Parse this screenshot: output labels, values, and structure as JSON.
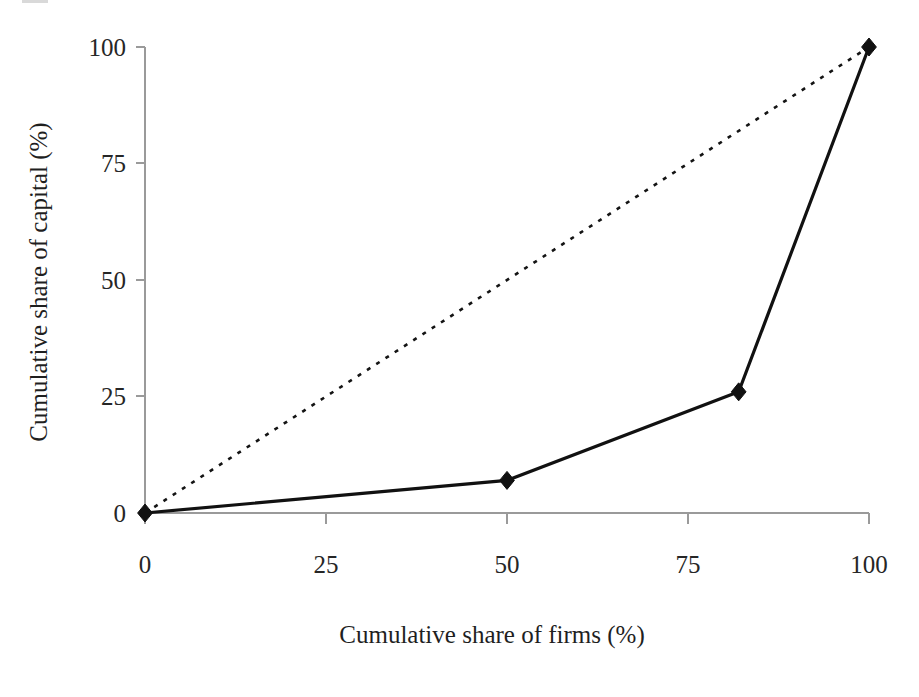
{
  "chart_data": {
    "type": "line",
    "title": "",
    "subtitle": "",
    "xlabel": "Cumulative share of firms (%)",
    "ylabel": "Cumulative share of capital (%)",
    "xlim": [
      0,
      100
    ],
    "ylim": [
      0,
      100
    ],
    "xticks": [
      0,
      25,
      50,
      75,
      100
    ],
    "yticks": [
      0,
      25,
      50,
      75,
      100
    ],
    "xtick_labels": [
      "0",
      "25",
      "50",
      "75",
      "100"
    ],
    "ytick_labels": [
      "0",
      "25",
      "50",
      "75",
      "100"
    ],
    "grid": false,
    "legend_position": "none",
    "series": [
      {
        "name": "Lorenz curve",
        "style": "solid",
        "marker": "diamond",
        "color": "#111111",
        "x": [
          0,
          50,
          82,
          100
        ],
        "y": [
          0,
          7,
          26,
          100
        ]
      },
      {
        "name": "Line of equality",
        "style": "dashed",
        "marker": "none",
        "color": "#141414",
        "x": [
          0,
          100
        ],
        "y": [
          0,
          100
        ]
      }
    ],
    "annotations": []
  },
  "axes": {
    "x_title": "Cumulative share of firms (%)",
    "y_title": "Cumulative share of capital (%)",
    "x_tick_0": "0",
    "x_tick_1": "25",
    "x_tick_2": "50",
    "x_tick_3": "75",
    "x_tick_4": "100",
    "y_tick_0": "0",
    "y_tick_1": "25",
    "y_tick_2": "50",
    "y_tick_3": "75",
    "y_tick_4": "100"
  },
  "colors": {
    "background": "#ffffff",
    "axis": "#9a9a9a",
    "lorenz": "#111111",
    "equality": "#141414",
    "text": "#1f1f1f"
  }
}
